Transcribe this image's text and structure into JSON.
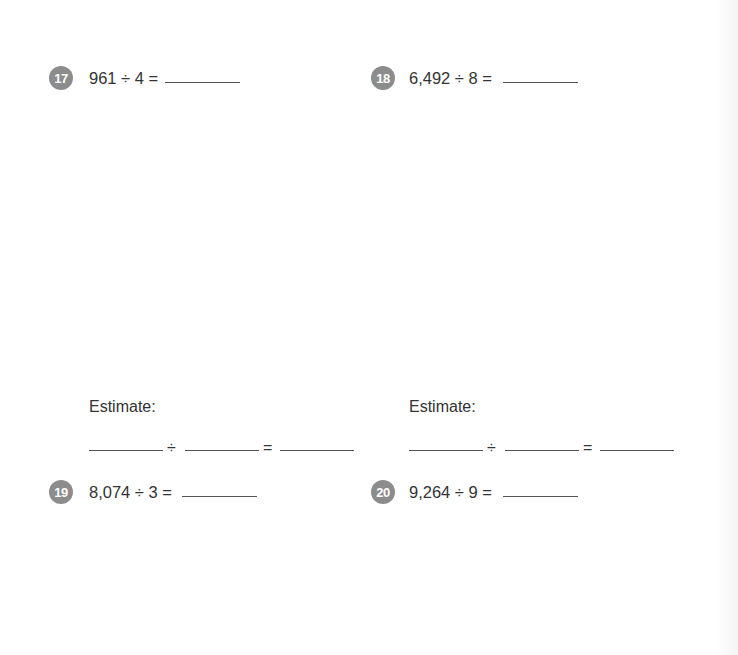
{
  "problems": [
    {
      "number": "17",
      "expression": "961 ÷ 4 =",
      "answer": ""
    },
    {
      "number": "18",
      "expression": "6,492 ÷ 8 =",
      "answer": ""
    },
    {
      "number": "19",
      "expression": "8,074 ÷ 3 =",
      "answer": ""
    },
    {
      "number": "20",
      "expression": "9,264 ÷ 9 =",
      "answer": ""
    }
  ],
  "estimates": [
    {
      "label": "Estimate:",
      "divide_symbol": "÷",
      "equals_symbol": "=",
      "dividend": "",
      "divisor": "",
      "quotient": ""
    },
    {
      "label": "Estimate:",
      "divide_symbol": "÷",
      "equals_symbol": "=",
      "dividend": "",
      "divisor": "",
      "quotient": ""
    }
  ],
  "colors": {
    "badge": "#8c8c8c",
    "text": "#333333",
    "line": "#555555"
  }
}
